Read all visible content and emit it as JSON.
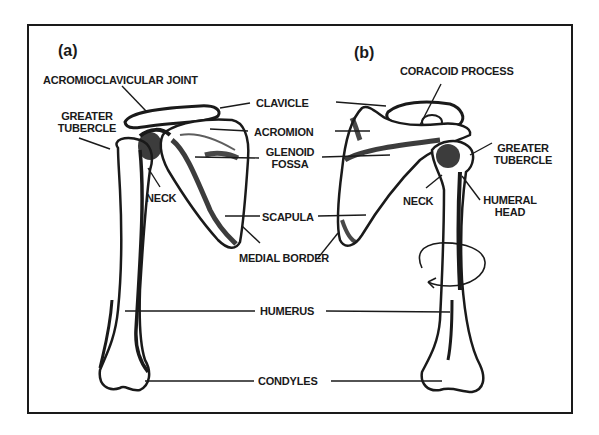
{
  "figure": {
    "panels": [
      {
        "id": "a",
        "label": "(a)"
      },
      {
        "id": "b",
        "label": "(b)"
      }
    ],
    "labels_left": {
      "acromioclavicular_joint": "ACROMIOCLAVICULAR JOINT",
      "greater_tubercle_1": "GREATER",
      "greater_tubercle_2": "TUBERCLE",
      "neck": "NECK"
    },
    "labels_center": {
      "clavicle": "CLAVICLE",
      "acromion": "ACROMION",
      "glenoid_fossa_1": "GLENOID",
      "glenoid_fossa_2": "FOSSA",
      "scapula": "SCAPULA",
      "medial_border": "MEDIAL BORDER",
      "humerus": "HUMERUS",
      "condyles": "CONDYLES"
    },
    "labels_right": {
      "coracoid_process": "CORACOID PROCESS",
      "greater_tubercle_1": "GREATER",
      "greater_tubercle_2": "TUBERCLE",
      "neck": "NECK",
      "humeral_head_1": "HUMERAL",
      "humeral_head_2": "HEAD"
    },
    "colors": {
      "ink": "#1a1a1a",
      "paper": "#ffffff"
    }
  }
}
